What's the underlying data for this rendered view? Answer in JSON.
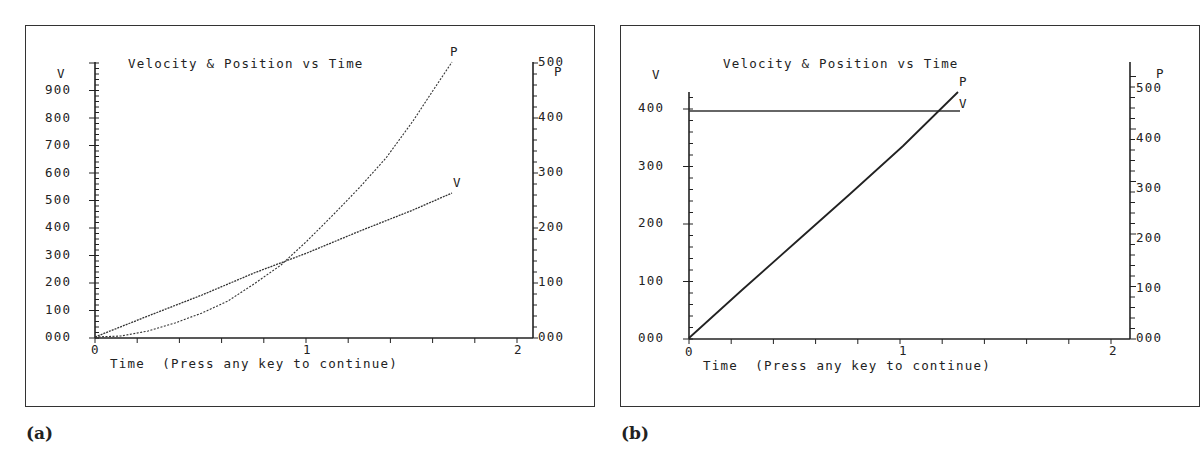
{
  "panels": [
    {
      "caption": "(a)",
      "title": "Velocity & Position vs Time",
      "left_axis_label": "V",
      "right_axis_label": "P",
      "left_ticks": [
        "000",
        "100",
        "200",
        "300",
        "400",
        "500",
        "600",
        "700",
        "800",
        "900"
      ],
      "right_ticks": [
        "000",
        "100",
        "200",
        "300",
        "400",
        "500"
      ],
      "x_ticks": [
        "0",
        "1",
        "2"
      ],
      "x_label": "Time  (Press any key to continue)",
      "series_labels": {
        "v": "V",
        "p": "P"
      }
    },
    {
      "caption": "(b)",
      "title": "Velocity & Position vs Time",
      "left_axis_label": "V",
      "right_axis_label": "P",
      "left_ticks": [
        "000",
        "100",
        "200",
        "300",
        "400"
      ],
      "right_ticks": [
        "000",
        "100",
        "200",
        "300",
        "400",
        "500"
      ],
      "x_ticks": [
        "0",
        "1",
        "2"
      ],
      "x_label": "Time  (Press any key to continue)",
      "series_labels": {
        "v": "V",
        "p": "P"
      }
    }
  ],
  "chart_data": [
    {
      "type": "line",
      "title": "Velocity & Position vs Time",
      "xlabel": "Time (Press any key to continue)",
      "ylabel": "V",
      "y2label": "P",
      "xlim": [
        0,
        2
      ],
      "ylim": [
        0,
        1000
      ],
      "y2lim": [
        0,
        500
      ],
      "grid": false,
      "series": [
        {
          "name": "V",
          "axis": "left",
          "x": [
            0,
            0.25,
            0.5,
            0.75,
            1.0,
            1.25,
            1.5,
            1.69
          ],
          "values": [
            0,
            88,
            175,
            263,
            350,
            438,
            525,
            592
          ]
        },
        {
          "name": "P",
          "axis": "right",
          "x": [
            0,
            0.25,
            0.5,
            0.75,
            1.0,
            1.25,
            1.5,
            1.69
          ],
          "values": [
            0,
            11,
            44,
            98,
            175,
            273,
            394,
            500
          ]
        }
      ]
    },
    {
      "type": "line",
      "title": "Velocity & Position vs Time",
      "xlabel": "Time (Press any key to continue)",
      "ylabel": "V",
      "y2label": "P",
      "xlim": [
        0,
        2
      ],
      "ylim": [
        0,
        400
      ],
      "y2lim": [
        0,
        500
      ],
      "grid": false,
      "series": [
        {
          "name": "V",
          "axis": "left",
          "x": [
            0,
            1.26
          ],
          "values": [
            395,
            395
          ]
        },
        {
          "name": "P",
          "axis": "right",
          "x": [
            0,
            0.5,
            1.0,
            1.26
          ],
          "values": [
            0,
            180,
            360,
            450
          ]
        }
      ]
    }
  ]
}
